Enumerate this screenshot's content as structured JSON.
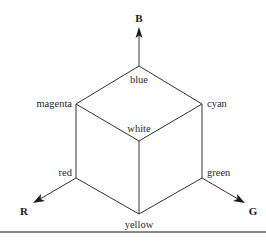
{
  "diagram": {
    "axes": {
      "blue": "B",
      "red": "R",
      "green": "G"
    },
    "vertices": {
      "top": "blue",
      "upper_left": "magenta",
      "upper_right": "cyan",
      "center": "white",
      "lower_left": "red",
      "lower_right": "green",
      "bottom": "yellow"
    },
    "colors": {
      "line": "#333333",
      "text": "#2a2a2a",
      "rule": "#8a8a8a"
    }
  }
}
